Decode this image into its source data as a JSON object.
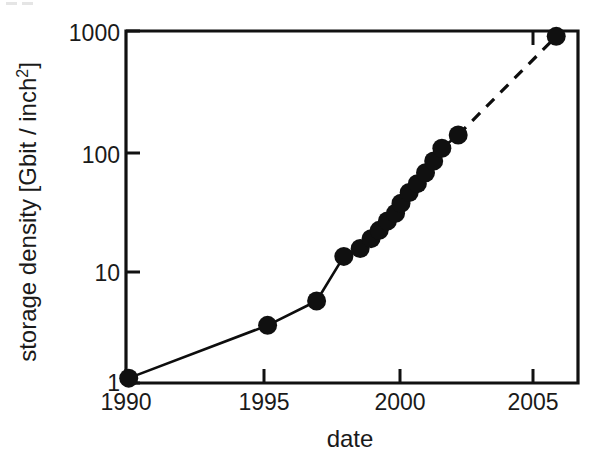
{
  "figure": {
    "background_color": "#ffffff",
    "ink_color": "#101010",
    "panel_label": ""
  },
  "axes": {
    "x": {
      "label": "date",
      "ticks": [
        "1990",
        "1995",
        "2000",
        "2005"
      ],
      "tick_values": [
        1990,
        1995,
        2000,
        2005
      ],
      "range": [
        1990,
        2006.6
      ]
    },
    "y": {
      "label_prefix": "storage density  [Gbit / inch",
      "label_suffix": "]",
      "label_superscript": "2",
      "label_full": "storage density [Gbit / inch2]",
      "ticks": [
        "1",
        "10",
        "100",
        "1000"
      ],
      "tick_values": [
        1,
        10,
        100,
        1000
      ],
      "scale": "log",
      "range": [
        1,
        1000
      ]
    }
  },
  "chart_data": {
    "type": "line",
    "title": "",
    "xlabel": "date",
    "ylabel": "storage density [Gbit / inch2]",
    "xlim": [
      1990,
      2006.6
    ],
    "ylim": [
      1,
      1000
    ],
    "yscale": "log",
    "grid": false,
    "legend": "none",
    "series": [
      {
        "name": "areal storage density (measured)",
        "style": "solid-line-with-filled-circles",
        "marker": "filled-circle",
        "color": "#101010",
        "x": [
          1990.1,
          1995.2,
          1997.0,
          1998.0,
          1998.6,
          1999.0,
          1999.3,
          1999.6,
          1999.9,
          2000.1,
          2000.4,
          2000.7,
          2001.0,
          2001.3,
          2001.6,
          2002.2
        ],
        "y": [
          1.1,
          3.1,
          5.0,
          12.0,
          14.0,
          17.0,
          20.0,
          24.0,
          28.0,
          34.0,
          42.0,
          50.0,
          62.0,
          78.0,
          100.0,
          130.0
        ]
      },
      {
        "name": "extrapolation",
        "style": "dashed-line",
        "marker": "filled-circle-endpoint",
        "color": "#101010",
        "x": [
          2002.2,
          2005.8
        ],
        "y": [
          130.0,
          900.0
        ]
      }
    ],
    "annotations": []
  }
}
